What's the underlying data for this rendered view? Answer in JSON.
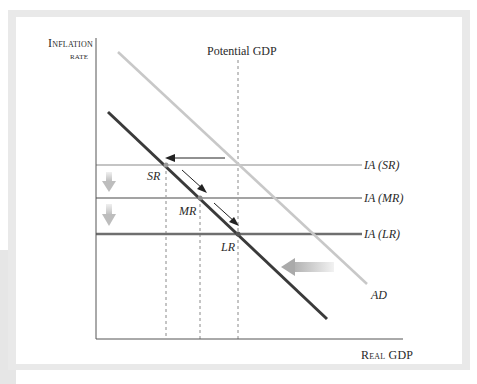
{
  "diagram": {
    "axes": {
      "y_label_line1": "Inflation",
      "y_label_line2": "rate",
      "x_label": "Real GDP"
    },
    "potential_gdp_label": "Potential GDP",
    "curves": {
      "ad_old_label": "AD",
      "ia_lines": [
        {
          "label": "IA (SR)",
          "color": "#c4c4c4"
        },
        {
          "label": "IA (MR)",
          "color": "#a3a3a3"
        },
        {
          "label": "IA (LR)",
          "color": "#6f6f6f"
        }
      ]
    },
    "points": {
      "sr": "SR",
      "mr": "MR",
      "lr": "LR"
    },
    "colors": {
      "frame": "#e9e9e9",
      "ad_old": "#c8c8c8",
      "ad_new": "#3a3a3a",
      "axis": "#555555",
      "dashed": "#888888",
      "shift_arrow": "#b8b8b8"
    }
  }
}
